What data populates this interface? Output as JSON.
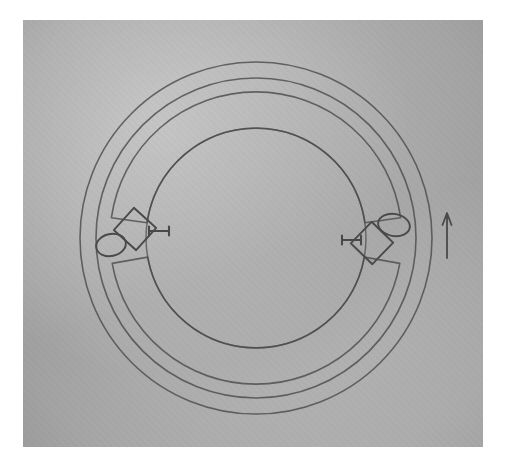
{
  "page": {
    "kind": "scanned-technical-drawing",
    "background_color": "#ffffff",
    "scan_paper_color": "#b4b4b4",
    "ink_color": "#4a4a4a",
    "width": 510,
    "height": 475
  },
  "scan": {
    "x": 23,
    "y": 20,
    "width": 460,
    "height": 427
  },
  "figure": {
    "title": "",
    "center": {
      "x": 256,
      "y": 238
    },
    "circles": [
      {
        "name": "outermost-circle",
        "radius": 176,
        "stroke_width": 1.6
      },
      {
        "name": "second-circle",
        "radius": 160,
        "stroke_width": 1.6
      },
      {
        "name": "inner-band-outer-circle",
        "radius": 146,
        "stroke_width": 1.5
      },
      {
        "name": "innermost-circle",
        "radius": 110,
        "stroke_width": 1.5
      }
    ],
    "arc_segments": [
      {
        "name": "upper-arc-segment",
        "start_deg": 188,
        "end_deg": 352,
        "inner_radius": 110,
        "outer_radius": 146
      },
      {
        "name": "lower-arc-segment",
        "start_deg": 10,
        "end_deg": 170,
        "inner_radius": 110,
        "outer_radius": 146
      }
    ],
    "gaps": [
      {
        "name": "left-gap",
        "angle_deg": 180
      },
      {
        "name": "right-gap",
        "angle_deg": 0
      }
    ]
  },
  "left_detail": {
    "ellipse": {
      "name": "left-ellipse",
      "cx": 111,
      "cy": 245,
      "rx": 15,
      "ry": 11,
      "rotation_deg": -12
    },
    "diamond": {
      "name": "left-diamond",
      "cx": 135,
      "cy": 229,
      "half": 15,
      "rotation_deg": 42
    },
    "dimension_marker": {
      "name": "left-dimension-marker",
      "x1": 149,
      "x2": 169,
      "y": 231,
      "cap_height": 9
    }
  },
  "right_detail": {
    "ellipse": {
      "name": "right-ellipse",
      "cx": 394,
      "cy": 225,
      "rx": 16,
      "ry": 11,
      "rotation_deg": 10
    },
    "diamond": {
      "name": "right-diamond",
      "cx": 372,
      "cy": 243,
      "half": 15,
      "rotation_deg": 44
    },
    "dimension_marker": {
      "name": "right-dimension-marker",
      "x1": 342,
      "x2": 361,
      "y": 240,
      "cap_height": 9
    }
  },
  "annotations": {
    "arrow": {
      "name": "up-arrow",
      "direction": "up",
      "x": 447,
      "tail_y": 258,
      "head_y": 213,
      "head_width": 9,
      "head_length": 12
    }
  },
  "labels": {
    "figure_caption": "",
    "part_numbers": []
  }
}
